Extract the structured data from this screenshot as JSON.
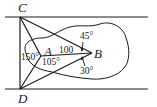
{
  "diagram": {
    "points": {
      "C": {
        "label": "C",
        "x": 20,
        "y": 17
      },
      "D": {
        "label": "D",
        "x": 20,
        "y": 89
      },
      "A": {
        "label": "A",
        "x": 41,
        "y": 56
      },
      "B": {
        "label": "B",
        "x": 92,
        "y": 53
      }
    },
    "labels": {
      "C": "C",
      "D": "D",
      "A": "A",
      "B": "B",
      "distance_AB": "100",
      "angle_CAD": "150°",
      "angle_BAD": "105°",
      "angle_CBA": "45°",
      "angle_ABD": "30°"
    },
    "colors": {
      "stroke": "#1a1a1a",
      "background": "#ffffff"
    }
  }
}
